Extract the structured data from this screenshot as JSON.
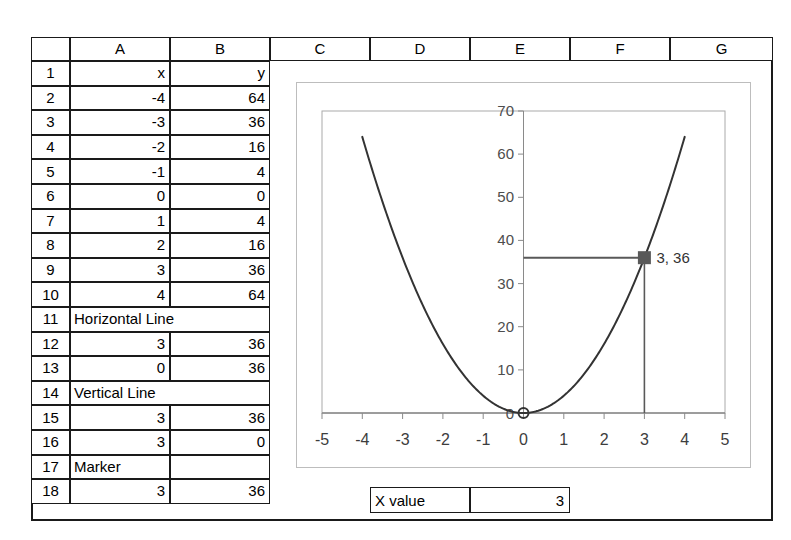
{
  "sheet": {
    "column_headers": [
      "A",
      "B",
      "C",
      "D",
      "E",
      "F",
      "G"
    ],
    "row_headers": [
      "1",
      "2",
      "3",
      "4",
      "5",
      "6",
      "7",
      "8",
      "9",
      "10",
      "11",
      "12",
      "13",
      "14",
      "15",
      "16",
      "17",
      "18"
    ],
    "rows": [
      {
        "n": "1",
        "a": "x",
        "b": "y",
        "merged": false,
        "a_align": "num",
        "b_align": "num"
      },
      {
        "n": "2",
        "a": "-4",
        "b": "64",
        "merged": false,
        "a_align": "num",
        "b_align": "num"
      },
      {
        "n": "3",
        "a": "-3",
        "b": "36",
        "merged": false,
        "a_align": "num",
        "b_align": "num"
      },
      {
        "n": "4",
        "a": "-2",
        "b": "16",
        "merged": false,
        "a_align": "num",
        "b_align": "num"
      },
      {
        "n": "5",
        "a": "-1",
        "b": "4",
        "merged": false,
        "a_align": "num",
        "b_align": "num"
      },
      {
        "n": "6",
        "a": "0",
        "b": "0",
        "merged": false,
        "a_align": "num",
        "b_align": "num"
      },
      {
        "n": "7",
        "a": "1",
        "b": "4",
        "merged": false,
        "a_align": "num",
        "b_align": "num"
      },
      {
        "n": "8",
        "a": "2",
        "b": "16",
        "merged": false,
        "a_align": "num",
        "b_align": "num"
      },
      {
        "n": "9",
        "a": "3",
        "b": "36",
        "merged": false,
        "a_align": "num",
        "b_align": "num"
      },
      {
        "n": "10",
        "a": "4",
        "b": "64",
        "merged": false,
        "a_align": "num",
        "b_align": "num"
      },
      {
        "n": "11",
        "a": "Horizontal Line",
        "b": "",
        "merged": true,
        "a_align": "txt",
        "b_align": "txt"
      },
      {
        "n": "12",
        "a": "3",
        "b": "36",
        "merged": false,
        "a_align": "num",
        "b_align": "num"
      },
      {
        "n": "13",
        "a": "0",
        "b": "36",
        "merged": false,
        "a_align": "num",
        "b_align": "num"
      },
      {
        "n": "14",
        "a": "Vertical Line",
        "b": "",
        "merged": true,
        "a_align": "txt",
        "b_align": "txt"
      },
      {
        "n": "15",
        "a": "3",
        "b": "36",
        "merged": false,
        "a_align": "num",
        "b_align": "num"
      },
      {
        "n": "16",
        "a": "3",
        "b": "0",
        "merged": false,
        "a_align": "num",
        "b_align": "num"
      },
      {
        "n": "17",
        "a": "Marker",
        "b": "",
        "merged": false,
        "a_align": "txt",
        "b_align": "txt"
      },
      {
        "n": "18",
        "a": "3",
        "b": "36",
        "merged": false,
        "a_align": "num",
        "b_align": "num"
      }
    ]
  },
  "controls": {
    "x_value_label": "X value",
    "x_value": "3"
  },
  "colors": {
    "grid_line": "#1a1a1a",
    "chart_border": "#bdbdbd",
    "curve": "#333333",
    "axis": "#808080",
    "marker": "#595959",
    "helper_line": "#595959"
  },
  "chart_data": {
    "type": "line",
    "title": "",
    "xlabel": "",
    "ylabel": "",
    "xlim": [
      -5,
      5
    ],
    "ylim": [
      0,
      70
    ],
    "xticks": [
      -5,
      -4,
      -3,
      -2,
      -1,
      0,
      1,
      2,
      3,
      4,
      5
    ],
    "xtick_labels": [
      "-5",
      "-4",
      "-3",
      "-2",
      "-1",
      "0",
      "1",
      "2",
      "3",
      "4",
      "5"
    ],
    "yticks": [
      0,
      10,
      20,
      30,
      40,
      50,
      60,
      70
    ],
    "ytick_labels": [
      "0",
      "10",
      "20",
      "30",
      "40",
      "50",
      "60",
      "70"
    ],
    "grid": false,
    "legend": "none",
    "series": [
      {
        "name": "y",
        "type": "line",
        "x": [
          -4,
          -3,
          -2,
          -1,
          0,
          1,
          2,
          3,
          4
        ],
        "values": [
          64,
          36,
          16,
          4,
          0,
          4,
          16,
          36,
          64
        ]
      },
      {
        "name": "Horizontal Line",
        "type": "line",
        "x": [
          3,
          0
        ],
        "values": [
          36,
          36
        ]
      },
      {
        "name": "Vertical Line",
        "type": "line",
        "x": [
          3,
          3
        ],
        "values": [
          36,
          0
        ]
      },
      {
        "name": "Marker",
        "type": "scatter",
        "x": [
          3
        ],
        "values": [
          36
        ],
        "point_label": "3, 36"
      }
    ],
    "annotations": [
      {
        "text": "3, 36",
        "x": 3,
        "y": 36
      }
    ]
  }
}
